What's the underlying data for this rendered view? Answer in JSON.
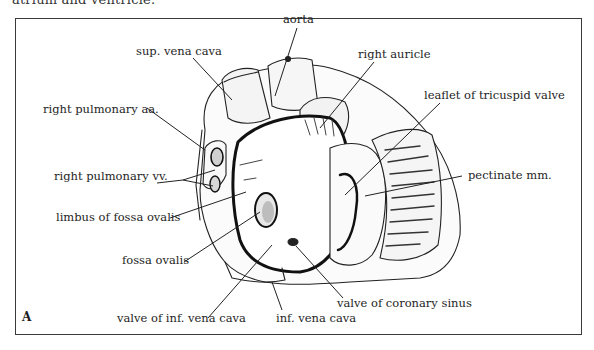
{
  "caption_top": "atrium and ventricle.",
  "figure": {
    "panel_letter": "A",
    "labels": [
      {
        "id": "aorta",
        "text": "aorta"
      },
      {
        "id": "sup-vena-cava",
        "text": "sup. vena cava"
      },
      {
        "id": "right-auricle",
        "text": "right auricle"
      },
      {
        "id": "right-pulmonary-aa",
        "text": "right pulmonary aa."
      },
      {
        "id": "leaflet-tricuspid",
        "text": "leaflet of tricuspid valve"
      },
      {
        "id": "right-pulmonary-vv",
        "text": "right pulmonary vv."
      },
      {
        "id": "pectinate-mm",
        "text": "pectinate mm."
      },
      {
        "id": "limbus-fossa-ovalis",
        "text": "limbus of fossa ovalis"
      },
      {
        "id": "fossa-ovalis",
        "text": "fossa ovalis"
      },
      {
        "id": "valve-coronary-sinus",
        "text": "valve of coronary sinus"
      },
      {
        "id": "valve-inf-vena-cava",
        "text": "valve of inf. vena cava"
      },
      {
        "id": "inf-vena-cava",
        "text": "inf. vena cava"
      }
    ]
  }
}
